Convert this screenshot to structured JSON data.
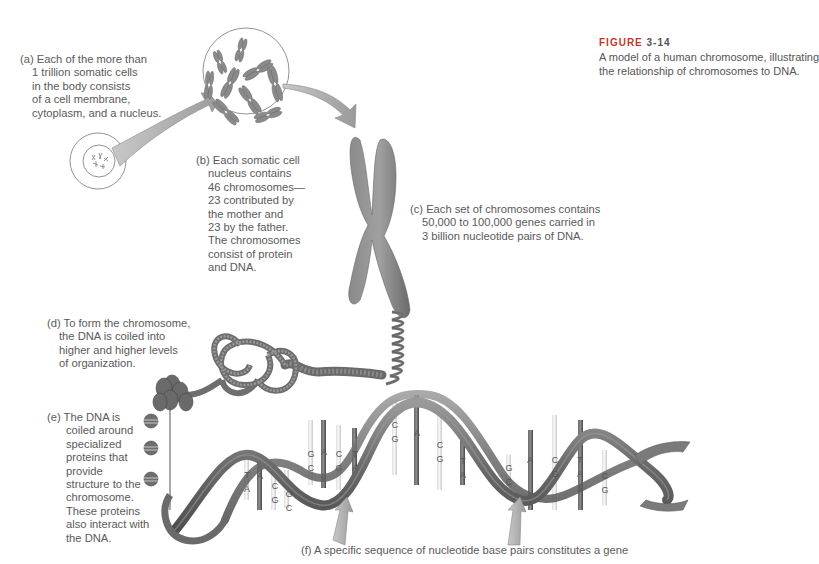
{
  "figure": {
    "label": "FIGURE",
    "number": "3-14",
    "caption_lines": [
      "A model of a human chromosome, illustrating",
      "the relationship of chromosomes to DNA."
    ]
  },
  "annotations": {
    "a": {
      "tag": "(a)",
      "lines": [
        "Each of the more than",
        "1 trillion somatic cells",
        "in the body consists",
        "of a cell membrane,",
        "cytoplasm, and a nucleus."
      ]
    },
    "b": {
      "tag": "(b)",
      "lines": [
        "Each somatic cell",
        "nucleus contains",
        "46 chromosomes—",
        "23 contributed by",
        "the mother and",
        "23 by the father.",
        "The chromosomes",
        "consist of protein",
        "and DNA."
      ]
    },
    "c": {
      "tag": "(c)",
      "lines": [
        "Each set of chromosomes contains",
        "50,000 to 100,000 genes carried in",
        "3 billion nucleotide pairs of DNA."
      ]
    },
    "d": {
      "tag": "(d)",
      "lines": [
        "To form the chromosome,",
        "the DNA is coiled into",
        "higher and higher levels",
        "of organization."
      ]
    },
    "e": {
      "tag": "(e)",
      "lines": [
        "The DNA is",
        "coiled around",
        "specialized",
        "proteins that",
        "provide",
        "structure to the",
        "chromosome.",
        "These proteins",
        "also interact with",
        "the DNA."
      ]
    },
    "f": {
      "tag": "(f)",
      "text": "A specific sequence of nucleotide base pairs constitutes a gene"
    }
  },
  "base_pairs": [
    {
      "top": "T",
      "bottom": "A"
    },
    {
      "top": "A",
      "bottom": "T"
    },
    {
      "top": "C",
      "bottom": "G"
    },
    {
      "top": "G",
      "bottom": "C"
    },
    {
      "top": "G",
      "bottom": "C"
    },
    {
      "top": "A",
      "bottom": "T"
    },
    {
      "top": "C",
      "bottom": "G"
    },
    {
      "top": "T",
      "bottom": "A"
    },
    {
      "top": "C",
      "bottom": "G"
    },
    {
      "top": "A",
      "bottom": "T"
    },
    {
      "top": "C",
      "bottom": "G"
    },
    {
      "top": "T",
      "bottom": "A"
    },
    {
      "top": "G",
      "bottom": "C"
    },
    {
      "top": "A",
      "bottom": "T"
    },
    {
      "top": "C",
      "bottom": "G"
    },
    {
      "top": "T",
      "bottom": "A"
    },
    {
      "top": "C",
      "bottom": "G"
    }
  ],
  "colors": {
    "figure_label": "#c0392b",
    "text": "#5a5a5a",
    "chromosome": "#7a7a7a",
    "helix": "#6e6e6e",
    "arrow": "#a8a8a8"
  }
}
